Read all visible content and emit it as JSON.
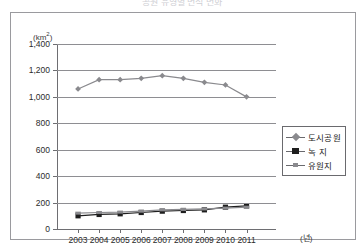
{
  "title": "공원 유형별 면적 변화",
  "axes": {
    "y_unit": "(km",
    "y_unit_sup": "2",
    "y_unit_close": ")",
    "x_unit": "(년)"
  },
  "legend": [
    {
      "label": "도시공원",
      "marker": "diamond",
      "color": "#8a8a8e"
    },
    {
      "label": "녹 지",
      "marker": "square",
      "color": "#1e1e1e"
    },
    {
      "label": "유원지",
      "marker": "cross",
      "color": "#8a8a8e"
    }
  ],
  "chart_data": {
    "type": "line",
    "title": "공원 유형별 면적 변화",
    "xlabel": "(년)",
    "ylabel": "(km2)",
    "categories": [
      "2003",
      "2004",
      "2005",
      "2006",
      "2007",
      "2008",
      "2009",
      "2010",
      "2011"
    ],
    "ylim": [
      0,
      1400
    ],
    "yticks": [
      "0",
      "200",
      "400",
      "600",
      "800",
      "1,000",
      "1,200",
      "1,400"
    ],
    "ytick_values": [
      0,
      200,
      400,
      600,
      800,
      1000,
      1200,
      1400
    ],
    "grid": true,
    "legend_position": "right-middle",
    "series": [
      {
        "name": "도시공원",
        "marker": "diamond",
        "color": "#8a8a8e",
        "values": [
          1060,
          1130,
          1130,
          1140,
          1160,
          1140,
          1110,
          1090,
          1000
        ]
      },
      {
        "name": "녹 지",
        "marker": "square",
        "color": "#1e1e1e",
        "values": [
          100,
          110,
          115,
          125,
          135,
          140,
          145,
          165,
          175
        ]
      },
      {
        "name": "유원지",
        "marker": "cross",
        "color": "#8a8a8e",
        "values": [
          120,
          125,
          128,
          135,
          145,
          148,
          152,
          158,
          165
        ]
      }
    ]
  }
}
